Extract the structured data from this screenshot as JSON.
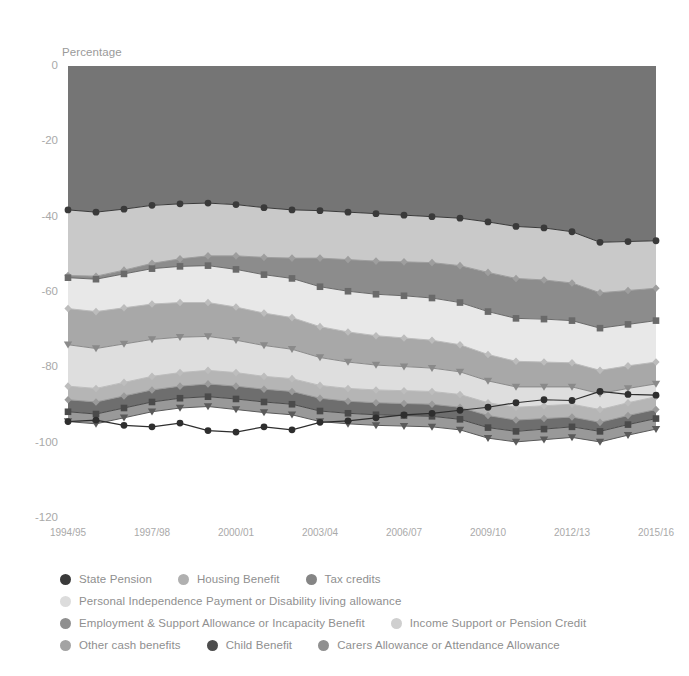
{
  "chart_data": {
    "type": "area",
    "stacked": true,
    "title": "",
    "ylabel": "Percentage",
    "xlabel": "",
    "ylim": [
      -120,
      0
    ],
    "yticks": [
      0,
      -20,
      -40,
      -60,
      -80,
      -100,
      -120
    ],
    "ytick_labels": [
      "0",
      "-20",
      "-40",
      "-60",
      "-80",
      "-100",
      "-120"
    ],
    "grid": false,
    "legend_position": "bottom",
    "x": [
      "1994/95",
      "1995/96",
      "1996/97",
      "1997/98",
      "1998/99",
      "1999/00",
      "2000/01",
      "2001/02",
      "2002/03",
      "2003/04",
      "2004/05",
      "2005/06",
      "2006/07",
      "2007/08",
      "2008/09",
      "2009/10",
      "2010/11",
      "2011/12",
      "2012/13",
      "2013/14",
      "2014/15",
      "2015/16"
    ],
    "xtick_labels": [
      "1994/95",
      "1997/98",
      "2000/01",
      "2003/04",
      "2006/07",
      "2009/10",
      "2012/13",
      "2015/16"
    ],
    "xtick_indices": [
      0,
      3,
      6,
      9,
      12,
      15,
      18,
      21
    ],
    "series": [
      {
        "name": "State Pension",
        "color": "#757575",
        "marker": "circle",
        "marker_color": "#3a3a3a",
        "values": [
          -38.2,
          -38.8,
          -38.0,
          -37.0,
          -36.6,
          -36.4,
          -36.8,
          -37.6,
          -38.2,
          -38.4,
          -38.8,
          -39.2,
          -39.6,
          -40.0,
          -40.4,
          -41.4,
          -42.6,
          -43.0,
          -44.0,
          -46.8,
          -46.6,
          -46.4
        ]
      },
      {
        "name": "Housing Benefit",
        "color": "#c9c9c9",
        "marker": "diamond",
        "marker_color": "#9e9e9e",
        "values": [
          -17.4,
          -17.0,
          -16.2,
          -15.4,
          -14.6,
          -14.0,
          -13.6,
          -13.2,
          -12.8,
          -12.6,
          -12.6,
          -12.6,
          -12.4,
          -12.2,
          -12.6,
          -13.4,
          -13.8,
          -13.8,
          -13.6,
          -13.4,
          -13.0,
          -12.6
        ]
      },
      {
        "name": "Tax credits",
        "color": "#8c8c8c",
        "marker": "square",
        "marker_color": "#6a6a6a",
        "values": [
          -0.6,
          -0.8,
          -1.0,
          -1.4,
          -2.0,
          -2.6,
          -3.6,
          -4.6,
          -5.4,
          -7.6,
          -8.4,
          -8.8,
          -9.0,
          -9.4,
          -9.8,
          -10.4,
          -10.6,
          -10.4,
          -10.0,
          -9.4,
          -9.0,
          -8.6
        ]
      },
      {
        "name": "Personal Independence Payment or Disability living allowance",
        "color": "#e8e8e8",
        "marker": "diamond",
        "marker_color": "#bcbcbc",
        "values": [
          -8.2,
          -8.6,
          -9.0,
          -9.4,
          -9.6,
          -9.8,
          -10.0,
          -10.2,
          -10.4,
          -10.6,
          -10.8,
          -11.0,
          -11.2,
          -11.2,
          -11.2,
          -11.4,
          -11.4,
          -11.4,
          -11.2,
          -11.2,
          -11.0,
          -11.0
        ]
      },
      {
        "name": "Employment & Support Allowance or Incapacity Benefit",
        "color": "#a8a8a8",
        "marker": "triangle",
        "marker_color": "#8a8a8a",
        "values": [
          -9.6,
          -9.8,
          -9.6,
          -9.4,
          -9.2,
          -9.0,
          -8.8,
          -8.6,
          -8.4,
          -8.2,
          -8.0,
          -7.8,
          -7.6,
          -7.4,
          -7.2,
          -7.0,
          -6.8,
          -6.6,
          -6.4,
          -6.2,
          -6.0,
          -5.8
        ]
      },
      {
        "name": "Income Support or Pension Credit",
        "color": "#dedede",
        "marker": "diamond",
        "marker_color": "#bdbdbd",
        "values": [
          -11.0,
          -10.6,
          -10.2,
          -9.8,
          -9.4,
          -9.0,
          -8.6,
          -8.2,
          -7.8,
          -7.4,
          -7.0,
          -6.6,
          -6.4,
          -6.2,
          -6.0,
          -5.8,
          -5.4,
          -5.0,
          -4.6,
          -4.2,
          -3.8,
          -3.4
        ]
      },
      {
        "name": "Other cash benefits",
        "color": "#b5b5b5",
        "marker": "diamond",
        "marker_color": "#9a9a9a",
        "values": [
          -3.6,
          -3.6,
          -3.6,
          -3.6,
          -3.6,
          -3.6,
          -3.6,
          -3.4,
          -3.4,
          -3.4,
          -3.4,
          -3.4,
          -3.4,
          -3.4,
          -3.4,
          -3.4,
          -3.4,
          -3.4,
          -3.4,
          -3.4,
          -3.4,
          -3.4
        ]
      },
      {
        "name": "Child Benefit",
        "color": "#6e6e6e",
        "marker": "square",
        "marker_color": "#4a4a4a",
        "values": [
          -3.2,
          -3.2,
          -3.2,
          -3.2,
          -3.2,
          -3.4,
          -3.4,
          -3.4,
          -3.4,
          -3.4,
          -3.2,
          -3.2,
          -3.2,
          -3.2,
          -3.2,
          -3.2,
          -3.0,
          -2.8,
          -2.6,
          -2.4,
          -2.4,
          -2.4
        ]
      },
      {
        "name": "Carers Allowance or Attendance Allowance",
        "color": "#999999",
        "marker": "triangle",
        "marker_color": "#5a5a5a",
        "values": [
          -2.6,
          -2.6,
          -2.6,
          -2.6,
          -2.6,
          -2.6,
          -2.8,
          -2.8,
          -2.8,
          -2.8,
          -2.8,
          -2.8,
          -2.8,
          -2.8,
          -2.8,
          -2.8,
          -2.8,
          -2.8,
          -2.8,
          -2.8,
          -2.8,
          -2.8
        ]
      }
    ],
    "total_line": {
      "name": "Total",
      "marker": "circle",
      "color": "#2e2e2e",
      "values": [
        -94.4,
        -94.0,
        -95.4,
        -95.8,
        -94.8,
        -96.8,
        -97.2,
        -95.8,
        -96.6,
        -94.6,
        -94.2,
        -93.4,
        -92.6,
        -92.2,
        -91.4,
        -90.6,
        -89.4,
        -88.6,
        -88.8,
        -86.4,
        -87.2,
        -87.4
      ]
    }
  },
  "legend": {
    "rows": [
      {
        "items": [
          {
            "label": "State Pension",
            "color": "#3a3a3a"
          },
          {
            "label": "Housing Benefit",
            "color": "#b0b0b0"
          },
          {
            "label": "Tax credits",
            "color": "#858585"
          }
        ]
      },
      {
        "items": [
          {
            "label": "Personal Independence Payment or Disability living allowance",
            "color": "#dcdcdc"
          }
        ]
      },
      {
        "items": [
          {
            "label": "Employment & Support Allowance or Incapacity Benefit",
            "color": "#8f8f8f"
          },
          {
            "label": "Income Support or Pension Credit",
            "color": "#cfcfcf"
          }
        ]
      },
      {
        "items": [
          {
            "label": "Other cash benefits",
            "color": "#a3a3a3"
          },
          {
            "label": "Child Benefit",
            "color": "#4d4d4d"
          },
          {
            "label": "Carers Allowance or Attendance Allowance",
            "color": "#909090"
          }
        ]
      }
    ]
  }
}
